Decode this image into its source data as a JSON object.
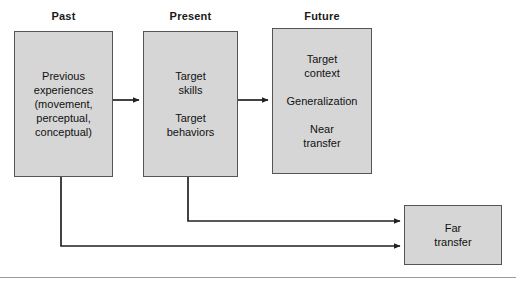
{
  "figure": {
    "background": "#ffffff",
    "box_fill": "#d6d6d6",
    "box_stroke": "#555555",
    "connector_color": "#222222",
    "rule_color": "#9a9a9a"
  },
  "columns": [
    {
      "label": "Past"
    },
    {
      "label": "Present"
    },
    {
      "label": "Future"
    }
  ],
  "nodes": {
    "past": {
      "paragraphs": [
        [
          "Previous",
          "experiences",
          "(movement,",
          "perceptual,",
          "conceptual)"
        ]
      ]
    },
    "present": {
      "paragraphs": [
        [
          "Target",
          "skills"
        ],
        [
          "Target",
          "behaviors"
        ]
      ]
    },
    "future": {
      "paragraphs": [
        [
          "Target",
          "context"
        ],
        [
          "Generalization"
        ],
        [
          "Near",
          "transfer"
        ]
      ]
    },
    "far": {
      "paragraphs": [
        [
          "Far",
          "transfer"
        ]
      ]
    }
  }
}
